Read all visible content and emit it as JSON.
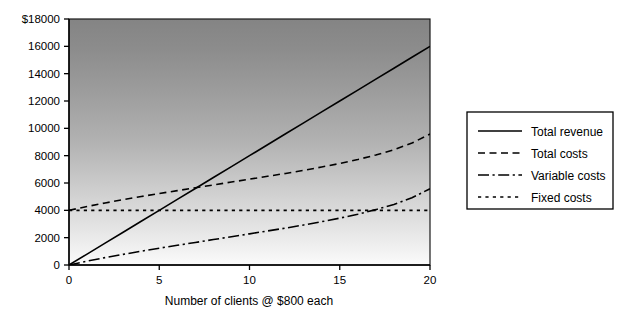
{
  "chart_data": {
    "type": "line",
    "title": "",
    "xlabel": "Number of clients @ $800 each",
    "ylabel": "",
    "xlim": [
      0,
      20
    ],
    "ylim": [
      0,
      18000
    ],
    "grid": false,
    "legend_position": "right",
    "x_ticks": [
      "0",
      "5",
      "10",
      "15",
      "20"
    ],
    "x_tick_values": [
      0,
      5,
      10,
      15,
      20
    ],
    "y_ticks": [
      "0",
      "2000",
      "4000",
      "6000",
      "8000",
      "10000",
      "12000",
      "14000",
      "16000",
      "$18000"
    ],
    "y_tick_values": [
      0,
      2000,
      4000,
      6000,
      8000,
      10000,
      12000,
      14000,
      16000,
      18000
    ],
    "x": [
      0,
      1,
      2,
      3,
      4,
      5,
      6,
      7,
      8,
      9,
      10,
      11,
      12,
      13,
      14,
      15,
      16,
      17,
      18,
      19,
      20
    ],
    "series": [
      {
        "name": "Total revenue",
        "style": "solid",
        "values": [
          0,
          800,
          1600,
          2400,
          3200,
          4000,
          4800,
          5600,
          6400,
          7200,
          8000,
          8800,
          9600,
          10400,
          11200,
          12000,
          12800,
          13600,
          14400,
          15200,
          16000
        ]
      },
      {
        "name": "Total costs",
        "style": "dashed",
        "values": [
          4000,
          4280,
          4540,
          4780,
          5010,
          5230,
          5440,
          5650,
          5860,
          6070,
          6280,
          6490,
          6700,
          6930,
          7170,
          7430,
          7720,
          8050,
          8430,
          8920,
          9580
        ]
      },
      {
        "name": "Variable costs",
        "style": "dash-dot",
        "values": [
          0,
          280,
          540,
          780,
          1010,
          1230,
          1440,
          1650,
          1860,
          2070,
          2280,
          2490,
          2700,
          2930,
          3170,
          3430,
          3720,
          4050,
          4430,
          4920,
          5580
        ]
      },
      {
        "name": "Fixed costs",
        "style": "dotted",
        "values": [
          4000,
          4000,
          4000,
          4000,
          4000,
          4000,
          4000,
          4000,
          4000,
          4000,
          4000,
          4000,
          4000,
          4000,
          4000,
          4000,
          4000,
          4000,
          4000,
          4000,
          4000
        ]
      }
    ],
    "annotations": [],
    "colors": {
      "line": "#000000",
      "plot_background_top": "#8b8b8b",
      "plot_background_bottom": "#f4f4f4",
      "page_background": "#ffffff"
    }
  },
  "legend": {
    "entries": [
      {
        "label": "Total revenue",
        "style": "solid"
      },
      {
        "label": "Total costs",
        "style": "dashed"
      },
      {
        "label": "Variable costs",
        "style": "dash-dot"
      },
      {
        "label": "Fixed costs",
        "style": "dotted"
      }
    ]
  },
  "axes": {
    "x_title": "Number of clients @ $800 each",
    "y_tick_top_label": "$18000"
  }
}
